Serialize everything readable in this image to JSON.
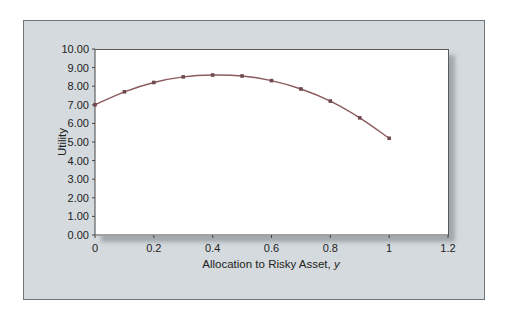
{
  "chart_data": {
    "type": "line",
    "title": "",
    "xlabel": "Allocation to Risky Asset, y",
    "xlabel_main": "Allocation to Risky Asset, ",
    "xlabel_var": "y",
    "ylabel": "Utility",
    "x": [
      0,
      0.1,
      0.2,
      0.3,
      0.4,
      0.5,
      0.6,
      0.7,
      0.8,
      0.9,
      1.0
    ],
    "series": [
      {
        "name": "Utility",
        "values": [
          7.0,
          7.7,
          8.2,
          8.5,
          8.6,
          8.55,
          8.3,
          7.85,
          7.2,
          6.3,
          5.2
        ],
        "color": "#8a5a5e"
      }
    ],
    "xlim": [
      0,
      1.2
    ],
    "ylim": [
      0,
      10
    ],
    "x_ticks": [
      "0",
      "0.2",
      "0.4",
      "0.6",
      "0.8",
      "1",
      "1.2"
    ],
    "y_ticks": [
      "0.00",
      "1.00",
      "2.00",
      "3.00",
      "4.00",
      "5.00",
      "6.00",
      "7.00",
      "8.00",
      "9.00",
      "10.00"
    ],
    "grid": false,
    "legend": "none"
  },
  "colors": {
    "panel_bg": "#d4dadd",
    "plot_bg": "#ffffff",
    "line": "#8a5a5e"
  }
}
